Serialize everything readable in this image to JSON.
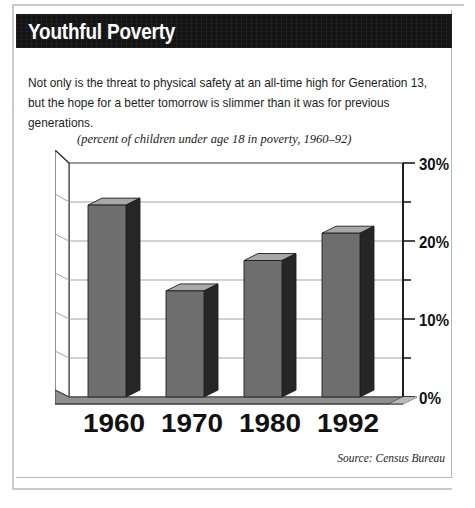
{
  "header": {
    "title": "Youthful Poverty"
  },
  "deck": {
    "text": "Not only is the threat to physical safety at an all-time high for Generation 13, but the hope for a better tomorrow is slimmer than it was for previous generations."
  },
  "chart_caption": "(percent of children under age 18 in poverty, 1960–92)",
  "source_note": "Source: Census Bureau",
  "axis": {
    "y_tick_labels": [
      "30%",
      "20%",
      "10%",
      "0%"
    ],
    "y_tick_values": [
      30,
      20,
      10,
      0
    ],
    "y_minor_values": [
      25,
      15,
      5
    ],
    "x_tick_labels": [
      "1960",
      "1970",
      "1980",
      "1992"
    ]
  },
  "colors": {
    "title_band": "#141414",
    "title_text": "#ffffff",
    "bar_front": "#6e6e6e",
    "bar_side": "#262626",
    "bar_top": "#a8a8a8",
    "floor": "#8f8f8f",
    "gridline": "#9a9a9a",
    "axis_line": "#1f1f1f",
    "page_background": "#ffffff",
    "frame_rule": "#c9c9c9"
  },
  "chart_data": {
    "type": "bar",
    "title": "Youthful Poverty",
    "subtitle": "(percent of children under age 18 in poverty, 1960–92)",
    "categories": [
      "1960",
      "1970",
      "1980",
      "1992"
    ],
    "values": [
      24.6,
      13.6,
      17.5,
      21.0
    ],
    "xlabel": "",
    "ylabel": "percent of children under age 18 in poverty",
    "ylim": [
      0,
      30
    ],
    "ytick_values": [
      0,
      10,
      20,
      30
    ],
    "ytick_labels": [
      "0%",
      "10%",
      "20%",
      "30%"
    ],
    "yminor_ticks": [
      5,
      15,
      25
    ],
    "grid": true,
    "legend": false,
    "style": "3d-column",
    "source": "Census Bureau"
  }
}
